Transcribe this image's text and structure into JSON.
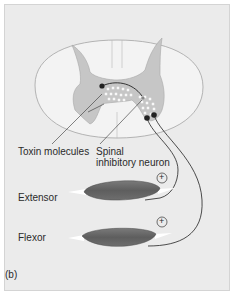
{
  "figure": {
    "panel_label": "(b)",
    "labels": {
      "toxin": "Toxin molecules",
      "spinal_line1": "Spinal",
      "spinal_line2": "inhibitory neuron",
      "extensor": "Extensor",
      "flexor": "Flexor"
    },
    "plus_symbol": "+",
    "colors": {
      "background": "#ebebeb",
      "white_matter": "#f2f2f2",
      "gray_matter": "#c8c8c8",
      "muscle": "#6a6a6a",
      "tendon": "#ffffff",
      "neuron": "#222222",
      "outline": "#9a9a9a"
    }
  }
}
